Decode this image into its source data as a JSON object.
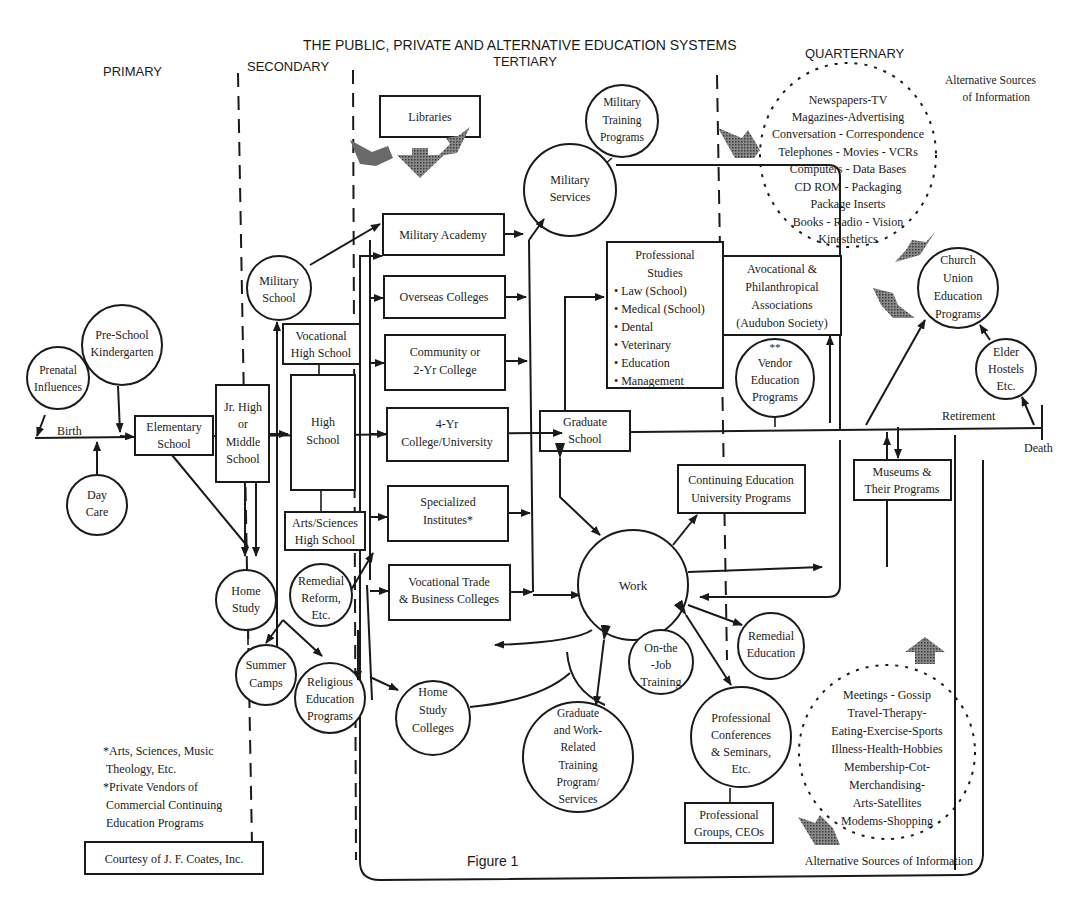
{
  "header": {
    "title": "THE PUBLIC, PRIVATE AND ALTERNATIVE EDUCATION SYSTEMS",
    "columns": [
      "PRIMARY",
      "SECONDARY",
      "TERTIARY",
      "QUARTERNARY"
    ]
  },
  "timeline": {
    "birth": "Birth",
    "retirement": "Retirement",
    "death": "Death"
  },
  "primary": {
    "prenatal": [
      "Prenatal",
      "Influences"
    ],
    "preschool": [
      "Pre-School",
      "Kindergarten"
    ],
    "daycare": [
      "Day",
      "Care"
    ],
    "elementary": [
      "Elementary",
      "School"
    ]
  },
  "secondary": {
    "jrhigh": [
      "Jr. High",
      "or",
      "Middle",
      "School"
    ],
    "military_school": [
      "Military",
      "School"
    ],
    "vocational_hs": [
      "Vocational",
      "High School"
    ],
    "high_school": [
      "High",
      "School"
    ],
    "arts_hs": [
      "Arts/Sciences",
      "High School"
    ],
    "home_study": [
      "Home",
      "Study"
    ],
    "remedial_reform": [
      "Remedial",
      "Reform,",
      "Etc."
    ],
    "summer_camps": [
      "Summer",
      "Camps"
    ],
    "religious": [
      "Religious",
      "Education",
      "Programs"
    ]
  },
  "tertiary": {
    "libraries": "Libraries",
    "military_training": [
      "Military",
      "Training",
      "Programs"
    ],
    "military_services": [
      "Military",
      "Services"
    ],
    "military_academy": "Military Academy",
    "overseas": "Overseas Colleges",
    "community": [
      "Community or",
      "2-Yr College"
    ],
    "four_year": [
      "4-Yr",
      "College/University"
    ],
    "specialized": [
      "Specialized",
      "Institutes*"
    ],
    "vocational_trade": [
      "Vocational Trade",
      "& Business  Colleges"
    ],
    "home_study_colleges": [
      "Home",
      "Study",
      "Colleges"
    ],
    "professional_studies": {
      "title": [
        "Professional",
        "Studies"
      ],
      "items": [
        "• Law (School)",
        "• Medical (School)",
        "• Dental",
        "• Veterinary",
        "• Education",
        "• Management"
      ]
    },
    "graduate_school": [
      "Graduate",
      "School"
    ],
    "work": "Work",
    "continuing_ed": [
      "Continuing Education",
      "University Programs"
    ],
    "on_job": [
      "On-the",
      "-Job",
      "Training"
    ],
    "grad_work_training": [
      "Graduate",
      "and Work-",
      "Related",
      "Training",
      "Program/",
      "Services"
    ],
    "remedial_education": [
      "Remedial",
      "Education"
    ],
    "prof_conferences": [
      "Professional",
      "Conferences",
      "& Seminars,",
      "Etc."
    ],
    "prof_groups": [
      "Professional",
      "Groups, CEOs"
    ],
    "figure_label": "Figure 1"
  },
  "quarternary": {
    "alt_sources_top": [
      "Alternative Sources",
      "of Information"
    ],
    "media_circle": [
      "Newspapers-TV",
      "Magazines-Advertising",
      "Conversation - Correspondence",
      "Telephones - Movies - VCRs",
      "Computers - Data Bases",
      "CD ROM - Packaging",
      "Package Inserts",
      "Books - Radio - Vision",
      "Kinesthetics"
    ],
    "avocational": [
      "Avocational &",
      "Philanthropical",
      "Associations",
      "(Audubon Society)"
    ],
    "vendor": [
      "**",
      "Vendor",
      "Education",
      "Programs"
    ],
    "church": [
      "Church",
      "Union",
      "Education",
      "Programs"
    ],
    "elder": [
      "Elder",
      "Hostels",
      "Etc."
    ],
    "museums": [
      "Museums &",
      "Their Programs"
    ],
    "social_circle": [
      "Meetings - Gossip",
      "Travel-Therapy-",
      "Eating-Exercise-Sports",
      "Illness-Health-Hobbies",
      "Membership-Cot-",
      "Merchandising-",
      "Arts-Satellites",
      "Modems-Shopping"
    ],
    "alt_sources_bottom": "Alternative Sources of Information"
  },
  "footnotes": {
    "lines": [
      "*Arts, Sciences, Music",
      "Theology, Etc.",
      "*Private Vendors of",
      "Commercial Continuing",
      "Education Programs"
    ],
    "courtesy": "Courtesy of J. F. Coates, Inc."
  }
}
